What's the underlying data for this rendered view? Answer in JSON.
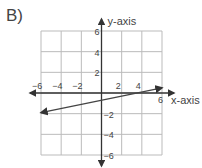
{
  "problem_label": "B)",
  "chart_data": {
    "type": "line",
    "title": "",
    "xlabel": "x-axis",
    "ylabel": "y-axis",
    "xlim": [
      -6,
      6
    ],
    "ylim": [
      -6,
      6
    ],
    "grid": true,
    "grid_step": 2,
    "x_ticks": [
      "-6",
      "-4",
      "-2",
      "2",
      "4",
      "6"
    ],
    "y_ticks": [
      "6",
      "4",
      "2",
      "-2",
      "-4",
      "-6"
    ],
    "series": [
      {
        "name": "line",
        "x": [
          -6,
          6
        ],
        "y": [
          -1.9,
          0.5
        ],
        "arrows": "both"
      }
    ],
    "colors": {
      "grid": "#bbbbbb",
      "axis": "#333333",
      "line": "#444444"
    }
  }
}
